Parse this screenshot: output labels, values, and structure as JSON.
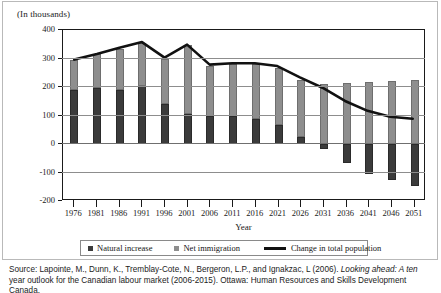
{
  "figure": {
    "units_label": "(In thousands)",
    "axis_title_x": "Year"
  },
  "legend": {
    "items": [
      {
        "label": "Natural increase",
        "marker": "square",
        "color": "#3b3b3b"
      },
      {
        "label": "Net immigration",
        "marker": "square",
        "color": "#8e8e8e"
      },
      {
        "label": "Change in total population",
        "marker": "line",
        "color": "#111111"
      }
    ]
  },
  "source": {
    "line1_prefix": "Source: Lapointe, M., Dunn, K., Tremblay-Cote, N., Bergeron, L.P., and Ignakzac, L (2006). ",
    "line1_italic": "Looking ahead: A ten",
    "line2": "year outlook for the Canadian labour market (2006-2015). Ottawa: Human Resources and Skills Development Canada."
  },
  "chart_data": {
    "type": "bar",
    "title": "",
    "subtitle": "",
    "xlabel": "Year",
    "ylabel": "(In thousands)",
    "ylim": [
      -200,
      400
    ],
    "yticks": [
      400,
      300,
      200,
      100,
      0,
      -100,
      -200
    ],
    "ytick_labels": [
      "400",
      "300",
      "200",
      "100",
      "0",
      "-100",
      "-200"
    ],
    "grid": true,
    "grid_axis": "y",
    "legend_position": "bottom",
    "stacked": true,
    "categories": [
      "1976",
      "1981",
      "1986",
      "1991",
      "1996",
      "2001",
      "2006",
      "2011",
      "2016",
      "2021",
      "2026",
      "2031",
      "2036",
      "2041",
      "2046",
      "2051"
    ],
    "series": [
      {
        "name": "Natural increase",
        "type": "bar",
        "color": "#3b3b3b",
        "values": [
          190,
          198,
          188,
          205,
          140,
          105,
          97,
          97,
          88,
          65,
          25,
          -18,
          -68,
          -105,
          -128,
          -148
        ]
      },
      {
        "name": "Net immigration",
        "type": "bar",
        "color": "#8e8e8e",
        "values": [
          105,
          117,
          147,
          150,
          160,
          243,
          178,
          183,
          192,
          200,
          200,
          210,
          215,
          218,
          220,
          223
        ]
      },
      {
        "name": "Change in total population",
        "type": "line",
        "color": "#111111",
        "values": [
          295,
          315,
          337,
          357,
          302,
          348,
          277,
          282,
          282,
          272,
          232,
          195,
          148,
          113,
          92,
          85
        ]
      }
    ]
  }
}
